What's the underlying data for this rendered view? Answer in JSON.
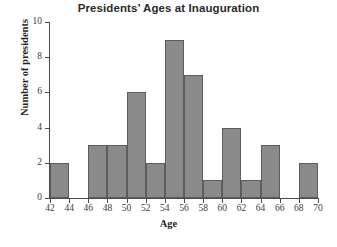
{
  "chart_data": {
    "type": "bar",
    "title": "Presidents’ Ages at Inauguration",
    "xlabel": "Age",
    "ylabel": "Number of presidents",
    "grid": false,
    "legend": null,
    "xlim": [
      42,
      70
    ],
    "ylim": [
      0,
      10
    ],
    "bin_width": 2,
    "xticks": [
      42,
      44,
      46,
      48,
      50,
      52,
      54,
      56,
      58,
      60,
      62,
      64,
      66,
      68,
      70
    ],
    "yticks": [
      0,
      2,
      4,
      6,
      8,
      10
    ],
    "categories": [
      "42-44",
      "44-46",
      "46-48",
      "48-50",
      "50-52",
      "52-54",
      "54-56",
      "56-58",
      "58-60",
      "60-62",
      "62-64",
      "64-66",
      "66-68",
      "68-70"
    ],
    "bin_starts": [
      42,
      44,
      46,
      48,
      50,
      52,
      54,
      56,
      58,
      60,
      62,
      64,
      66,
      68
    ],
    "values": [
      2,
      0,
      3,
      3,
      6,
      2,
      9,
      7,
      1,
      4,
      1,
      3,
      0,
      2
    ],
    "bar_color": "#8a8a8a",
    "bar_edge_color": "#5c5c5c",
    "axis_color": "#4a4a4a",
    "background_color": "#ffffff",
    "title_color": "#2b2b2b"
  }
}
